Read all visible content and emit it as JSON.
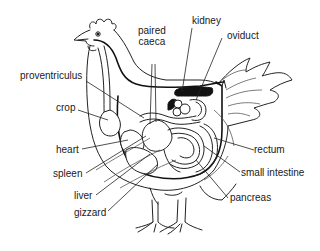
{
  "diagram": {
    "labels": {
      "paired_caeca": "paired\ncaeca",
      "paired_caeca_line1": "paired",
      "paired_caeca_line2": "caeca",
      "kidney": "kidney",
      "oviduct": "oviduct",
      "proventriculus": "proventriculus",
      "crop": "crop",
      "heart": "heart",
      "spleen": "spleen",
      "liver": "liver",
      "gizzard": "gizzard",
      "rectum": "rectum",
      "small_intestine": "small intestine",
      "pancreas": "pancreas"
    },
    "colors": {
      "line": "#222222",
      "kidney_fill": "#111111",
      "background": "#ffffff"
    }
  }
}
